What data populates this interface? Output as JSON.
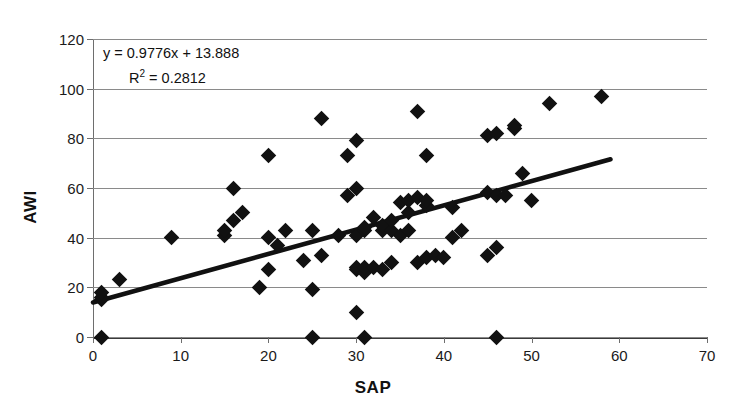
{
  "chart_data": {
    "type": "scatter",
    "title": "",
    "xlabel": "SAP",
    "ylabel": "AWI",
    "xlim": [
      0,
      70
    ],
    "ylim": [
      0,
      120
    ],
    "xticks": [
      0,
      10,
      20,
      30,
      40,
      50,
      60,
      70
    ],
    "yticks": [
      0,
      20,
      40,
      60,
      80,
      100,
      120
    ],
    "grid": "horizontal",
    "legend": "none",
    "marker": "diamond",
    "marker_color": "#111111",
    "annotations": {
      "equation": "y = 0.9776x + 13.888",
      "r_squared_label": "R",
      "r_squared_exponent": "2",
      "r_squared_value": " = 0.2812"
    },
    "trendline": {
      "type": "linear",
      "slope": 0.9776,
      "intercept": 13.888,
      "r_squared": 0.2812,
      "x_start": 0,
      "x_end": 59,
      "color": "#111111"
    },
    "points": [
      {
        "x": 1,
        "y": 0
      },
      {
        "x": 1,
        "y": 15
      },
      {
        "x": 1,
        "y": 16
      },
      {
        "x": 1,
        "y": 18
      },
      {
        "x": 3,
        "y": 23
      },
      {
        "x": 9,
        "y": 40
      },
      {
        "x": 15,
        "y": 41
      },
      {
        "x": 15,
        "y": 43
      },
      {
        "x": 16,
        "y": 47
      },
      {
        "x": 16,
        "y": 60
      },
      {
        "x": 17,
        "y": 50
      },
      {
        "x": 19,
        "y": 20
      },
      {
        "x": 20,
        "y": 27
      },
      {
        "x": 20,
        "y": 40
      },
      {
        "x": 20,
        "y": 73
      },
      {
        "x": 21,
        "y": 37
      },
      {
        "x": 22,
        "y": 43
      },
      {
        "x": 24,
        "y": 31
      },
      {
        "x": 25,
        "y": 0
      },
      {
        "x": 25,
        "y": 19
      },
      {
        "x": 25,
        "y": 43
      },
      {
        "x": 26,
        "y": 33
      },
      {
        "x": 26,
        "y": 88
      },
      {
        "x": 28,
        "y": 41
      },
      {
        "x": 29,
        "y": 57
      },
      {
        "x": 29,
        "y": 73
      },
      {
        "x": 30,
        "y": 10
      },
      {
        "x": 30,
        "y": 27
      },
      {
        "x": 30,
        "y": 28
      },
      {
        "x": 30,
        "y": 41
      },
      {
        "x": 30,
        "y": 60
      },
      {
        "x": 30,
        "y": 79
      },
      {
        "x": 31,
        "y": 0
      },
      {
        "x": 31,
        "y": 26
      },
      {
        "x": 31,
        "y": 28
      },
      {
        "x": 31,
        "y": 43
      },
      {
        "x": 31,
        "y": 44
      },
      {
        "x": 32,
        "y": 28
      },
      {
        "x": 32,
        "y": 48
      },
      {
        "x": 33,
        "y": 27
      },
      {
        "x": 33,
        "y": 43
      },
      {
        "x": 33,
        "y": 45
      },
      {
        "x": 34,
        "y": 30
      },
      {
        "x": 34,
        "y": 43
      },
      {
        "x": 34,
        "y": 47
      },
      {
        "x": 35,
        "y": 41
      },
      {
        "x": 35,
        "y": 54
      },
      {
        "x": 36,
        "y": 43
      },
      {
        "x": 36,
        "y": 50
      },
      {
        "x": 36,
        "y": 55
      },
      {
        "x": 37,
        "y": 30
      },
      {
        "x": 37,
        "y": 56
      },
      {
        "x": 37,
        "y": 91
      },
      {
        "x": 38,
        "y": 32
      },
      {
        "x": 38,
        "y": 53
      },
      {
        "x": 38,
        "y": 55
      },
      {
        "x": 38,
        "y": 73
      },
      {
        "x": 39,
        "y": 33
      },
      {
        "x": 40,
        "y": 32
      },
      {
        "x": 41,
        "y": 40
      },
      {
        "x": 41,
        "y": 52
      },
      {
        "x": 42,
        "y": 43
      },
      {
        "x": 45,
        "y": 33
      },
      {
        "x": 45,
        "y": 58
      },
      {
        "x": 45,
        "y": 81
      },
      {
        "x": 46,
        "y": 0
      },
      {
        "x": 46,
        "y": 36
      },
      {
        "x": 46,
        "y": 57
      },
      {
        "x": 46,
        "y": 82
      },
      {
        "x": 47,
        "y": 57
      },
      {
        "x": 48,
        "y": 84
      },
      {
        "x": 48,
        "y": 85
      },
      {
        "x": 49,
        "y": 66
      },
      {
        "x": 50,
        "y": 55
      },
      {
        "x": 52,
        "y": 94
      },
      {
        "x": 58,
        "y": 97
      }
    ]
  }
}
